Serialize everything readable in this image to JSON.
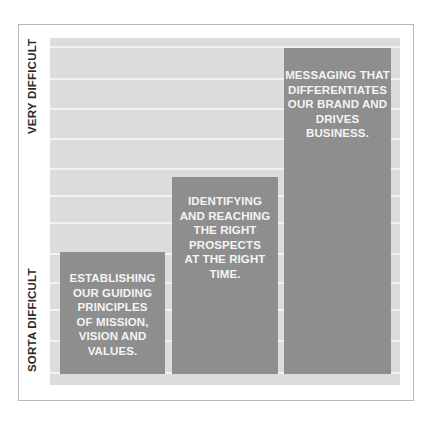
{
  "axis": {
    "top_label": "VERY DIFFICULT",
    "bottom_label": "SORTA DIFFICULT"
  },
  "colors": {
    "background": "#dcdcdc",
    "bar": "#8e8e8e",
    "bar_text": "#f4f4f4",
    "label_text": "#2a2a2a"
  },
  "bars": [
    {
      "lines": [
        "ESTABLISHING",
        "OUR GUIDING",
        "PRINCIPLES",
        "OF MISSION,",
        "VISION AND",
        "VALUES."
      ]
    },
    {
      "lines": [
        "IDENTIFYING",
        "AND REACHING",
        "THE RIGHT",
        "PROSPECTS",
        "AT THE RIGHT",
        "TIME."
      ]
    },
    {
      "lines": [
        "MESSAGING THAT",
        "DIFFERENTIATES",
        "OUR BRAND AND",
        "DRIVES BUSINESS."
      ]
    }
  ]
}
